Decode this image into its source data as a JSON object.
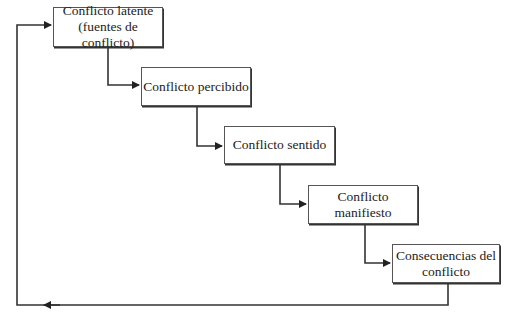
{
  "diagram": {
    "type": "flow",
    "nodes": [
      {
        "id": "latente",
        "label": "Conflicto latente\n(fuentes de conflicto)",
        "x": 53,
        "y": 7,
        "w": 110,
        "h": 40
      },
      {
        "id": "percibido",
        "label": "Conflicto percibido",
        "x": 141,
        "y": 67,
        "w": 110,
        "h": 39
      },
      {
        "id": "sentido",
        "label": "Conflicto sentido",
        "x": 224,
        "y": 126,
        "w": 111,
        "h": 38
      },
      {
        "id": "manifiesto",
        "label": "Conflicto manifiesto",
        "x": 308,
        "y": 185,
        "w": 110,
        "h": 39
      },
      {
        "id": "consecuencias",
        "label": "Consecuencias del\nconflicto",
        "x": 392,
        "y": 244,
        "w": 108,
        "h": 39
      }
    ],
    "edges": [
      {
        "from": "latente",
        "to": "percibido"
      },
      {
        "from": "percibido",
        "to": "sentido"
      },
      {
        "from": "sentido",
        "to": "manifiesto"
      },
      {
        "from": "manifiesto",
        "to": "consecuencias"
      },
      {
        "from": "consecuencias",
        "to": "latente",
        "kind": "feedback"
      }
    ],
    "line_color": "#333333"
  }
}
